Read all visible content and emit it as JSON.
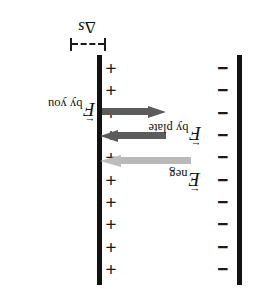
{
  "figure": {
    "orientation": "rotated-180",
    "background_color": "#ffffff"
  },
  "plates": {
    "positive": {
      "name": "positively charged plate",
      "charge_symbol": "+",
      "charge_count": 10,
      "bar_color": "#121212"
    },
    "negative": {
      "name": "negatively charged plate",
      "charge_symbol": "−",
      "charge_count": 10,
      "bar_color": "#121212"
    }
  },
  "gap": {
    "label_delta": "Δ",
    "label_variable": "s",
    "marker_style": "dashed dimension line with end ticks"
  },
  "vectors": [
    {
      "id": "f-by-you",
      "symbol": "F",
      "subscript": "by you",
      "accent": "←",
      "color": "#5c5c5c",
      "direction": "left"
    },
    {
      "id": "f-by-plate",
      "symbol": "F",
      "subscript": "by plate",
      "accent": "←",
      "color": "#5c5c5c",
      "direction": "right"
    },
    {
      "id": "e-neg",
      "symbol": "E",
      "subscript": "neg",
      "accent": "←",
      "color": "#bdbdbd",
      "direction": "right"
    }
  ],
  "charges": {
    "plus_list": [
      "+",
      "+",
      "+",
      "+",
      "+",
      "+",
      "+",
      "+",
      "+",
      "+"
    ],
    "minus_list": [
      "−",
      "−",
      "−",
      "−",
      "−",
      "−",
      "−",
      "−",
      "−",
      "−"
    ]
  }
}
